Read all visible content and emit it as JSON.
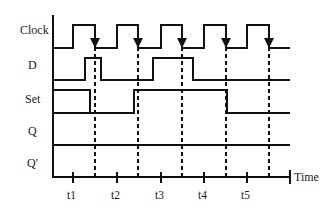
{
  "diagram": {
    "type": "timing-diagram",
    "signals": [
      {
        "name": "Clock",
        "label_y": 32
      },
      {
        "name": "D",
        "label_y": 66
      },
      {
        "name": "Set",
        "label_y": 100
      },
      {
        "name": "Q",
        "label_y": 131
      },
      {
        "name": "Q'",
        "label_y": 163
      }
    ],
    "time_axis": {
      "label": "Time",
      "ticks": [
        "t1",
        "t2",
        "t3",
        "t4",
        "t5"
      ]
    },
    "clock": {
      "pulses": [
        [
          73,
          95
        ],
        [
          117,
          138
        ],
        [
          161,
          182
        ],
        [
          204,
          226
        ],
        [
          247,
          269
        ]
      ],
      "falling_edge_arrows": [
        95,
        138,
        182,
        226,
        269
      ]
    },
    "d": {
      "pulses": [
        [
          85,
          101
        ],
        [
          153,
          193
        ]
      ]
    },
    "set": {
      "high_intervals": [
        [
          53,
          90
        ],
        [
          134,
          227
        ]
      ]
    },
    "dashed_sample_lines": [
      95,
      138,
      182,
      226,
      269
    ],
    "colors": {
      "line": "#111111",
      "text": "#1a1a1a",
      "background": "#ffffff"
    }
  }
}
